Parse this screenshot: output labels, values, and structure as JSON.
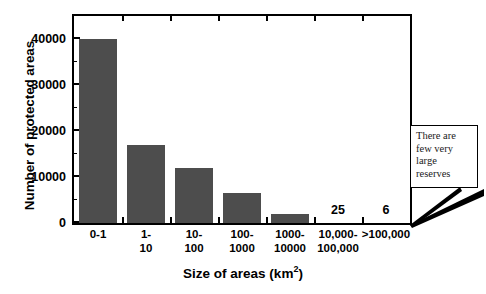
{
  "chart_data": {
    "type": "bar",
    "title": "",
    "xlabel": "Size of areas (km2)",
    "xlabel_base": "Size of areas (km",
    "xlabel_sup": "2",
    "xlabel_close": ")",
    "ylabel": "Number of protected areas",
    "categories": [
      "0-1",
      "1-\n10",
      "10-\n100",
      "100-\n1000",
      "1000-\n10000",
      "10,000-\n100,000",
      ">100,000"
    ],
    "category_lines": [
      [
        "0-1",
        ""
      ],
      [
        "1-",
        "10"
      ],
      [
        "10-",
        "100"
      ],
      [
        "100-",
        "1000"
      ],
      [
        "1000-",
        "10000"
      ],
      [
        "10,000-",
        "100,000"
      ],
      [
        ">100,000",
        ""
      ]
    ],
    "values": [
      40000,
      17000,
      12000,
      6500,
      2000,
      25,
      6
    ],
    "value_labels": [
      "",
      "",
      "",
      "",
      "",
      "25",
      "6"
    ],
    "ylim": [
      0,
      45000
    ],
    "yticks": [
      0,
      10000,
      20000,
      30000,
      40000
    ],
    "ytick_labels": [
      "0",
      "10000",
      "20000",
      "30000",
      "40000"
    ],
    "grid": false,
    "legend": false,
    "bar_color": "#4d4d4d",
    "axis_color": "#000000",
    "annotations": [
      {
        "name": "few-large-reserves-callout",
        "lines": [
          "There are",
          "few very",
          "large",
          "reserves"
        ],
        "points_to": ">100,000"
      }
    ]
  }
}
